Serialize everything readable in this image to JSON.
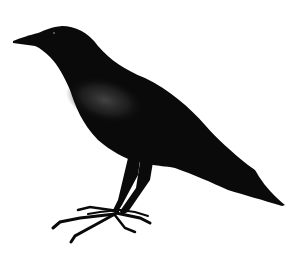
{
  "image": {
    "subject": "Crow silhouette",
    "description": "Black crow standing in profile facing left on a white background",
    "colors": {
      "background": "#ffffff",
      "body": "#0a0a0a",
      "sheen": "#3a3a3a"
    }
  }
}
